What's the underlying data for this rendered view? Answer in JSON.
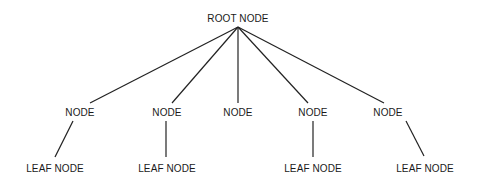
{
  "diagram": {
    "type": "tree",
    "line_color": "#222222",
    "text_color": "#1a1a1a",
    "root": {
      "label": "ROOT NODE",
      "x": 238,
      "y": 18
    },
    "nodes": [
      {
        "id": "n1",
        "label": "NODE",
        "x": 80,
        "y": 112
      },
      {
        "id": "n2",
        "label": "NODE",
        "x": 167,
        "y": 112
      },
      {
        "id": "n3",
        "label": "NODE",
        "x": 238,
        "y": 112
      },
      {
        "id": "n4",
        "label": "NODE",
        "x": 313,
        "y": 112
      },
      {
        "id": "n5",
        "label": "NODE",
        "x": 388,
        "y": 112
      }
    ],
    "leaves": [
      {
        "id": "l1",
        "parent": "n1",
        "label": "LEAF NODE",
        "x": 55,
        "y": 168
      },
      {
        "id": "l2",
        "parent": "n2",
        "label": "LEAF NODE",
        "x": 167,
        "y": 168
      },
      {
        "id": "l4",
        "parent": "n4",
        "label": "LEAF NODE",
        "x": 313,
        "y": 168
      },
      {
        "id": "l5",
        "parent": "n5",
        "label": "LEAF NODE",
        "x": 425,
        "y": 168
      }
    ]
  }
}
